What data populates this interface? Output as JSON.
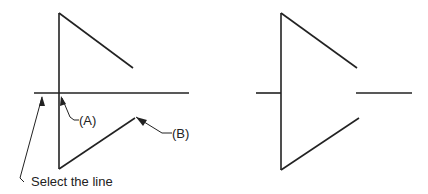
{
  "labels": {
    "a": "(A)",
    "b": "(B)",
    "instruction": "Select the line"
  },
  "colors": {
    "line": "#222222",
    "background": "#ffffff"
  },
  "figures": [
    {
      "name": "before-trim",
      "description": "Triangle with horizontal line crossing the vertical edge"
    },
    {
      "name": "after-trim",
      "description": "Triangle with horizontal line trimmed inside"
    }
  ]
}
